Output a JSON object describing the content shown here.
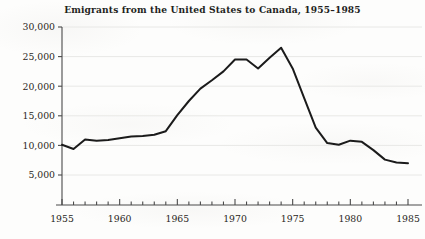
{
  "chart_data": {
    "type": "line",
    "title": "Emigrants from the United States to Canada, 1955–1985",
    "xlabel": "",
    "ylabel": "",
    "xlim": [
      1955,
      1985
    ],
    "ylim": [
      3000,
      30000
    ],
    "grid": true,
    "legend": null,
    "y_ticks": [
      5000,
      10000,
      15000,
      20000,
      25000,
      30000
    ],
    "y_tick_labels": [
      "5,000",
      "10,000",
      "15,000",
      "20,000",
      "25,000",
      "30,000"
    ],
    "x_ticks": [
      1955,
      1960,
      1965,
      1970,
      1975,
      1980,
      1985
    ],
    "x_tick_labels": [
      "1955",
      "1960",
      "1965",
      "1970",
      "1975",
      "1980",
      "1985"
    ],
    "x_minor_tick_interval": 1,
    "series": [
      {
        "name": "Emigrants from the United States to Canada",
        "color": "#1b1b1b",
        "x": [
          1955,
          1956,
          1957,
          1958,
          1959,
          1960,
          1961,
          1962,
          1963,
          1964,
          1965,
          1966,
          1967,
          1968,
          1969,
          1970,
          1971,
          1972,
          1973,
          1974,
          1975,
          1976,
          1977,
          1978,
          1979,
          1980,
          1981,
          1982,
          1983,
          1984,
          1985
        ],
        "values": [
          10100,
          9400,
          11000,
          10800,
          10900,
          11200,
          11500,
          11600,
          11800,
          12400,
          15100,
          17500,
          19600,
          21000,
          22500,
          24500,
          24500,
          23000,
          24800,
          26500,
          23000,
          18000,
          13000,
          10400,
          10100,
          10800,
          10600,
          9200,
          7600,
          7100,
          7000
        ]
      }
    ]
  },
  "axis_colors": {
    "axis_line": "#4a4a4a",
    "grid_line": "#e8e8e6",
    "series_line": "#1b1b1b"
  }
}
